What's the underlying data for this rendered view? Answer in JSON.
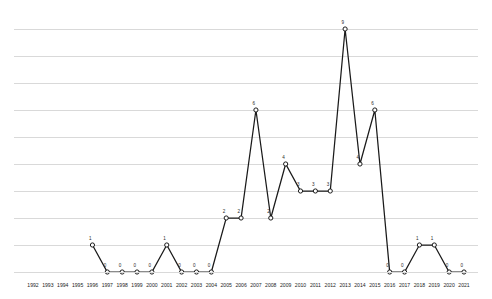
{
  "chart_data": {
    "type": "line",
    "title": "",
    "subtitle": "",
    "xlabel": "",
    "ylabel": "",
    "grid": true,
    "legend": null,
    "ylim": [
      0,
      9
    ],
    "y_gridline_values": [
      1,
      2,
      3,
      4,
      5,
      6,
      7,
      8,
      9
    ],
    "categories": [
      "1992",
      "1993",
      "1994",
      "1995",
      "1996",
      "1997",
      "1998",
      "1999",
      "2000",
      "2001",
      "2002",
      "2003",
      "2004",
      "2005",
      "2006",
      "2007",
      "2008",
      "2009",
      "2010",
      "2011",
      "2012",
      "2013",
      "2014",
      "2015",
      "2016",
      "2017",
      "2018",
      "2019",
      "2020",
      "2021"
    ],
    "series": [
      {
        "name": "",
        "marker": "circle-open",
        "color": "#1a1a1a",
        "points": [
          {
            "x": "1992",
            "y": null,
            "label": ""
          },
          {
            "x": "1993",
            "y": null,
            "label": ""
          },
          {
            "x": "1994",
            "y": null,
            "label": ""
          },
          {
            "x": "1995",
            "y": null,
            "label": ""
          },
          {
            "x": "1996",
            "y": 1,
            "label": "1"
          },
          {
            "x": "1997",
            "y": 0,
            "label": "0"
          },
          {
            "x": "1998",
            "y": 0,
            "label": "0"
          },
          {
            "x": "1999",
            "y": 0,
            "label": "0"
          },
          {
            "x": "2000",
            "y": 0,
            "label": "0"
          },
          {
            "x": "2001",
            "y": 1,
            "label": "1"
          },
          {
            "x": "2002",
            "y": 0,
            "label": "0"
          },
          {
            "x": "2003",
            "y": 0,
            "label": "0"
          },
          {
            "x": "2004",
            "y": 0,
            "label": "0"
          },
          {
            "x": "2005",
            "y": 2,
            "label": "2"
          },
          {
            "x": "2006",
            "y": 2,
            "label": "2"
          },
          {
            "x": "2007",
            "y": 6,
            "label": "6"
          },
          {
            "x": "2008",
            "y": 2,
            "label": "2"
          },
          {
            "x": "2009",
            "y": 4,
            "label": "4"
          },
          {
            "x": "2010",
            "y": 3,
            "label": "3"
          },
          {
            "x": "2011",
            "y": 3,
            "label": "3"
          },
          {
            "x": "2012",
            "y": 3,
            "label": "3"
          },
          {
            "x": "2013",
            "y": 9,
            "label": "9"
          },
          {
            "x": "2014",
            "y": 4,
            "label": "4"
          },
          {
            "x": "2015",
            "y": 6,
            "label": "6"
          },
          {
            "x": "2016",
            "y": 0,
            "label": "0"
          },
          {
            "x": "2017",
            "y": 0,
            "label": "0"
          },
          {
            "x": "2018",
            "y": 1,
            "label": "1"
          },
          {
            "x": "2019",
            "y": 1,
            "label": "1"
          },
          {
            "x": "2020",
            "y": 0,
            "label": "0"
          },
          {
            "x": "2021",
            "y": 0,
            "label": "0"
          }
        ]
      }
    ],
    "colors": {
      "line": "#1a1a1a",
      "marker_fill": "#ffffff",
      "gridline": "#d9d9d9",
      "text": "#1c1c1c",
      "background": "#ffffff"
    }
  }
}
